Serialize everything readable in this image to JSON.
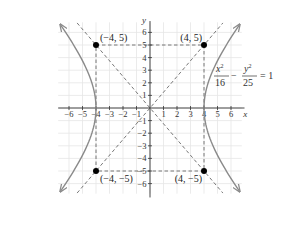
{
  "chart_data": {
    "type": "diagram",
    "title": "",
    "equation": {
      "num_x": "x",
      "den_x": "16",
      "num_y": "y",
      "den_y": "25",
      "exp": "2",
      "minus": "−",
      "rhs": "= 1"
    },
    "xlabel": "x",
    "ylabel": "y",
    "xlim": [
      -6.5,
      7
    ],
    "ylim": [
      -7,
      7
    ],
    "x_ticks": [
      -6,
      -5,
      -4,
      -3,
      -2,
      -1,
      1,
      2,
      3,
      4,
      5,
      6
    ],
    "y_ticks": [
      -6,
      -5,
      -4,
      -3,
      -2,
      -1,
      1,
      2,
      3,
      4,
      5,
      6
    ],
    "a": 4,
    "b": 5,
    "vertices": [
      [
        -4,
        0
      ],
      [
        4,
        0
      ]
    ],
    "asymptotes": [
      "y = 5x/4",
      "y = -5x/4"
    ],
    "points": [
      {
        "x": -4,
        "y": 5,
        "label": "(−4, 5)"
      },
      {
        "x": 4,
        "y": 5,
        "label": "(4, 5)"
      },
      {
        "x": -4,
        "y": -5,
        "label": "(−4, −5)"
      },
      {
        "x": 4,
        "y": -5,
        "label": "(4, −5)"
      }
    ],
    "grid": true,
    "colors": {
      "curve": "#8a8a8a",
      "grid": "#e6e6e6",
      "axis": "#333333",
      "dash": "#555555",
      "point": "#000000"
    }
  }
}
